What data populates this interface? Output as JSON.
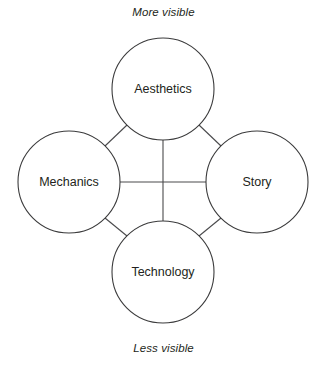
{
  "diagram": {
    "type": "node-link-diagram",
    "background_color": "#ffffff",
    "stroke_color": "#3b3b3c",
    "text_color": "#231f20",
    "axis_labels": {
      "top": "More visible",
      "bottom": "Less visible"
    },
    "nodes": [
      {
        "id": "aesthetics",
        "label": "Aesthetics",
        "position": "top",
        "cx": 163,
        "cy": 89,
        "r": 51
      },
      {
        "id": "mechanics",
        "label": "Mechanics",
        "position": "left",
        "cx": 69,
        "cy": 182,
        "r": 51
      },
      {
        "id": "story",
        "label": "Story",
        "position": "right",
        "cx": 257,
        "cy": 182,
        "r": 51
      },
      {
        "id": "technology",
        "label": "Technology",
        "position": "bottom",
        "cx": 163,
        "cy": 272,
        "r": 51
      }
    ],
    "connections": [
      {
        "id": "aesthetics-technology",
        "from": "aesthetics",
        "to": "technology",
        "kind": "vertical"
      },
      {
        "id": "mechanics-story",
        "from": "mechanics",
        "to": "story",
        "kind": "horizontal"
      },
      {
        "id": "aesthetics-mechanics",
        "from": "aesthetics",
        "to": "mechanics",
        "kind": "diagonal"
      },
      {
        "id": "aesthetics-story",
        "from": "aesthetics",
        "to": "story",
        "kind": "diagonal"
      },
      {
        "id": "mechanics-technology",
        "from": "mechanics",
        "to": "technology",
        "kind": "diagonal"
      },
      {
        "id": "story-technology",
        "from": "story",
        "to": "technology",
        "kind": "diagonal"
      }
    ]
  }
}
